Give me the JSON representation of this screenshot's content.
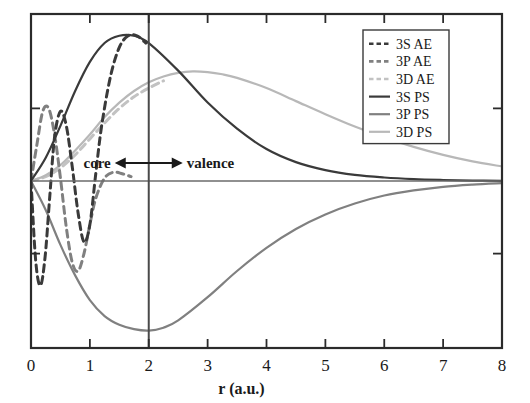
{
  "figure": {
    "title": "",
    "background": "#ffffff"
  },
  "axes": {
    "xlabel": "r (a.u.)",
    "ylabel": "",
    "xticks": [
      "0",
      "1",
      "2",
      "3",
      "4",
      "5",
      "6",
      "7",
      "8"
    ],
    "xlim": [
      0,
      8
    ],
    "ylim": [
      -1.15,
      1.15
    ],
    "frame_color": "#2b2b2b",
    "zero_line_color": "#6b6b6b"
  },
  "annotations": {
    "core_label": "core",
    "valence_label": "valence",
    "divider_r": 2,
    "arrow_glyph": "double-headed-arrow"
  },
  "legend": {
    "position": "upper-right",
    "entries": [
      {
        "label": "3S AE",
        "color": "#3a3a3a",
        "style": "dashed"
      },
      {
        "label": "3P AE",
        "color": "#808080",
        "style": "dashed"
      },
      {
        "label": "3D AE",
        "color": "#c2c2c2",
        "style": "dashed"
      },
      {
        "label": "3S PS",
        "color": "#3a3a3a",
        "style": "solid"
      },
      {
        "label": "3P PS",
        "color": "#808080",
        "style": "solid"
      },
      {
        "label": "3D PS",
        "color": "#b8b8b8",
        "style": "solid"
      }
    ]
  },
  "chart_data": {
    "type": "line",
    "title": "",
    "xlabel": "r (a.u.)",
    "ylabel": "",
    "xlim": [
      0,
      8
    ],
    "ylim": [
      -1.15,
      1.15
    ],
    "grid": false,
    "legend_position": "upper-right",
    "annotations": [
      {
        "text": "core",
        "x": 1.1,
        "y": 0.12
      },
      {
        "text": "valence",
        "x": 3.0,
        "y": 0.12
      },
      {
        "type": "vline",
        "x": 2
      },
      {
        "type": "hline",
        "y": 0
      }
    ],
    "series": [
      {
        "name": "3S AE",
        "style": "dashed",
        "color": "#3a3a3a",
        "x": [
          0.0,
          0.08,
          0.16,
          0.24,
          0.32,
          0.4,
          0.5,
          0.6,
          0.7,
          0.8,
          0.9,
          1.0,
          1.1,
          1.2,
          1.35,
          1.5,
          1.65,
          1.8,
          1.95
        ],
        "y": [
          0.0,
          -0.55,
          -0.72,
          -0.52,
          -0.1,
          0.3,
          0.48,
          0.38,
          0.1,
          -0.22,
          -0.42,
          -0.3,
          0.05,
          0.38,
          0.72,
          0.92,
          1.0,
          1.0,
          0.95
        ]
      },
      {
        "name": "3P AE",
        "style": "dashed",
        "color": "#808080",
        "x": [
          0.0,
          0.1,
          0.2,
          0.3,
          0.4,
          0.5,
          0.6,
          0.7,
          0.8,
          0.9,
          1.0,
          1.1,
          1.25,
          1.4,
          1.55,
          1.7
        ],
        "y": [
          0.0,
          0.25,
          0.48,
          0.5,
          0.32,
          0.02,
          -0.32,
          -0.56,
          -0.62,
          -0.5,
          -0.3,
          -0.12,
          0.02,
          0.06,
          0.05,
          0.03
        ]
      },
      {
        "name": "3D AE",
        "style": "dashed",
        "color": "#c2c2c2",
        "x": [
          0.0,
          0.25,
          0.5,
          0.75,
          1.0,
          1.25,
          1.5,
          1.75,
          2.0,
          2.25
        ],
        "y": [
          0.0,
          0.03,
          0.09,
          0.18,
          0.29,
          0.4,
          0.5,
          0.58,
          0.64,
          0.69
        ]
      },
      {
        "name": "3S PS",
        "style": "solid",
        "color": "#3a3a3a",
        "x": [
          0.0,
          0.25,
          0.5,
          0.75,
          1.0,
          1.25,
          1.5,
          1.75,
          2.0,
          2.5,
          3.0,
          3.5,
          4.0,
          4.5,
          5.0,
          5.5,
          6.0,
          6.5,
          7.0,
          7.5,
          8.0
        ],
        "y": [
          0.0,
          0.16,
          0.38,
          0.62,
          0.82,
          0.95,
          1.0,
          1.0,
          0.95,
          0.76,
          0.54,
          0.36,
          0.22,
          0.13,
          0.075,
          0.042,
          0.024,
          0.013,
          0.007,
          0.003,
          0.001
        ]
      },
      {
        "name": "3P PS",
        "style": "solid",
        "color": "#808080",
        "x": [
          0.0,
          0.25,
          0.5,
          0.75,
          1.0,
          1.25,
          1.5,
          1.75,
          2.0,
          2.25,
          2.5,
          3.0,
          3.5,
          4.0,
          4.5,
          5.0,
          5.5,
          6.0,
          6.5,
          7.0,
          7.5,
          8.0
        ],
        "y": [
          0.0,
          -0.2,
          -0.44,
          -0.65,
          -0.82,
          -0.93,
          -0.99,
          -1.02,
          -1.03,
          -1.01,
          -0.96,
          -0.8,
          -0.62,
          -0.46,
          -0.33,
          -0.23,
          -0.155,
          -0.1,
          -0.065,
          -0.04,
          -0.025,
          -0.015
        ]
      },
      {
        "name": "3D PS",
        "style": "solid",
        "color": "#b8b8b8",
        "x": [
          0.0,
          0.25,
          0.5,
          0.75,
          1.0,
          1.25,
          1.5,
          1.75,
          2.0,
          2.25,
          2.5,
          2.75,
          3.0,
          3.25,
          3.5,
          4.0,
          4.5,
          5.0,
          5.5,
          6.0,
          6.5,
          7.0,
          7.5,
          8.0
        ],
        "y": [
          0.0,
          0.04,
          0.11,
          0.21,
          0.32,
          0.44,
          0.54,
          0.62,
          0.68,
          0.72,
          0.745,
          0.755,
          0.75,
          0.735,
          0.71,
          0.64,
          0.55,
          0.46,
          0.375,
          0.3,
          0.235,
          0.18,
          0.135,
          0.1
        ]
      }
    ]
  }
}
